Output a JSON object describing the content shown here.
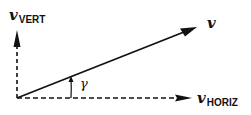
{
  "diagram": {
    "vectors": [
      {
        "id": "v",
        "label": "v",
        "subscript": "",
        "style": "solid",
        "from": [
          17,
          98
        ],
        "to": [
          197,
          27
        ]
      },
      {
        "id": "v_vert",
        "label": "v",
        "subscript": "VERT",
        "style": "dashed",
        "from": [
          17,
          98
        ],
        "to": [
          17,
          30
        ]
      },
      {
        "id": "v_horiz",
        "label": "v",
        "subscript": "HORIZ",
        "style": "dashed",
        "from": [
          17,
          98
        ],
        "to": [
          192,
          98
        ]
      }
    ],
    "angle": {
      "symbol": "γ",
      "between": [
        "v_horiz",
        "v"
      ]
    },
    "colors": {
      "stroke": "#111111",
      "background": "#ffffff"
    }
  }
}
